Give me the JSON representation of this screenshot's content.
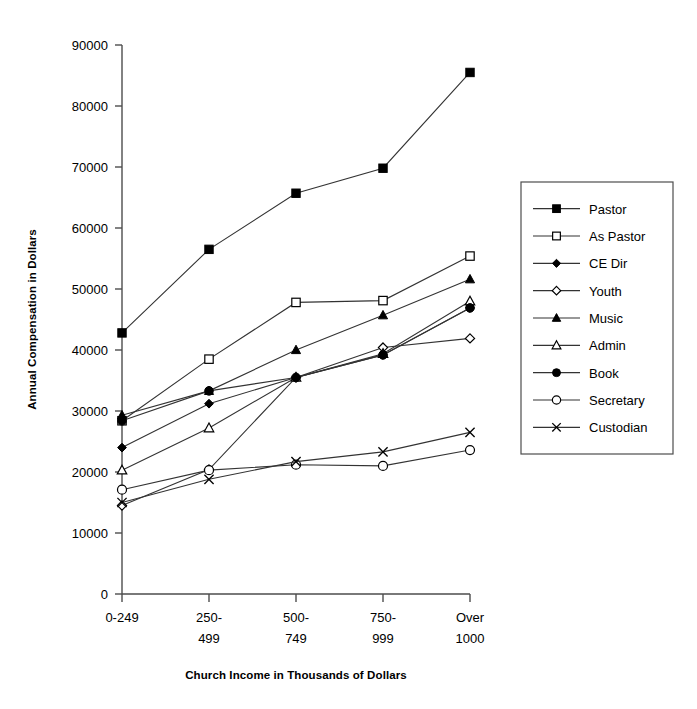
{
  "chart_data": {
    "type": "line",
    "title": "",
    "xlabel": "Church Income in Thousands of Dollars",
    "ylabel": "Annual Compensation in Dollars",
    "categories": [
      "0-249",
      "250-499",
      "500-749",
      "750-999",
      "Over 1000"
    ],
    "category_lines": [
      [
        "0-249"
      ],
      [
        "250-",
        "499"
      ],
      [
        "500-",
        "749"
      ],
      [
        "750-",
        "999"
      ],
      [
        "Over",
        "1000"
      ]
    ],
    "ylim": [
      0,
      90000
    ],
    "yticks": [
      0,
      10000,
      20000,
      30000,
      40000,
      50000,
      60000,
      70000,
      80000,
      90000
    ],
    "ytick_labels": [
      "0",
      "10000",
      "20000",
      "30000",
      "40000",
      "50000",
      "60000",
      "70000",
      "80000",
      "90000"
    ],
    "grid": false,
    "legend_position": "right",
    "line_color": "#333333",
    "series": [
      {
        "name": "Pastor",
        "marker": "filled-square",
        "values": [
          42800,
          56500,
          65700,
          69800,
          85500
        ]
      },
      {
        "name": "As Pastor",
        "marker": "open-square",
        "values": [
          28400,
          38500,
          47800,
          48100,
          55400
        ]
      },
      {
        "name": "CE Dir",
        "marker": "filled-diamond",
        "values": [
          24000,
          31200,
          35500,
          39200,
          46900
        ]
      },
      {
        "name": "Youth",
        "marker": "open-diamond",
        "values": [
          14500,
          20400,
          35500,
          40400,
          41900
        ]
      },
      {
        "name": "Music",
        "marker": "filled-triangle",
        "values": [
          29300,
          33300,
          40000,
          45700,
          51600
        ]
      },
      {
        "name": "Admin",
        "marker": "open-triangle",
        "values": [
          20300,
          27200,
          35500,
          39400,
          48000
        ]
      },
      {
        "name": "Book",
        "marker": "filled-circle",
        "values": [
          28400,
          33300,
          35500,
          39200,
          46900
        ]
      },
      {
        "name": "Secretary",
        "marker": "open-circle",
        "values": [
          17100,
          20300,
          21200,
          21000,
          23600
        ]
      },
      {
        "name": "Custodian",
        "marker": "cross",
        "values": [
          15000,
          18800,
          21700,
          23300,
          26500
        ]
      }
    ]
  }
}
